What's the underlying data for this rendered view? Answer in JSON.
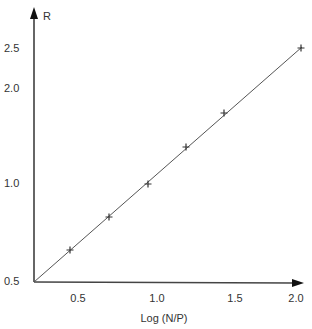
{
  "chart_data": {
    "type": "scatter",
    "title": "",
    "xlabel": "Log (N/P)",
    "ylabel": "R",
    "x_ticks": [
      "0.5",
      "1.0",
      "1.5",
      "2.0"
    ],
    "y_ticks": [
      "0.5",
      "1.0",
      "2.0",
      "2.5"
    ],
    "xlim": [
      0.2,
      2.0
    ],
    "ylim": [
      0.5,
      2.5
    ],
    "grid": false,
    "legend": null,
    "series": [
      {
        "name": "data",
        "marker": "+",
        "x": [
          0.45,
          0.7,
          0.94,
          1.19,
          1.43,
          2.0
        ],
        "y": [
          0.66,
          0.83,
          1.0,
          1.39,
          1.74,
          2.5
        ]
      }
    ],
    "fit_line": {
      "from": [
        0.2,
        0.5
      ],
      "to": [
        2.0,
        2.5
      ],
      "style": "solid"
    },
    "colors": {
      "axis": "#333333",
      "line": "#555555",
      "marker": "#333333"
    }
  },
  "pixel_map": {
    "x": [
      [
        0.5,
        78
      ],
      [
        1.0,
        157
      ],
      [
        1.5,
        235
      ],
      [
        2.0,
        296
      ]
    ],
    "y": [
      [
        0.5,
        281
      ],
      [
        1.0,
        183
      ],
      [
        2.0,
        88
      ],
      [
        2.5,
        48
      ]
    ],
    "points": [
      [
        70,
        250
      ],
      [
        109,
        217
      ],
      [
        148,
        184
      ],
      [
        186,
        147
      ],
      [
        224,
        113
      ],
      [
        301,
        48
      ]
    ]
  }
}
